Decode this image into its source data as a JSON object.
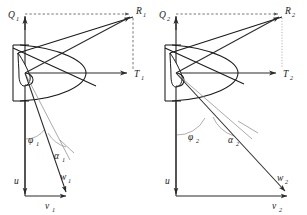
{
  "figure": {
    "type": "technical-diagram",
    "background_color": "#ffffff",
    "line_color": "#1a1a1a",
    "thin_line_color": "#8d8d8d",
    "dashed_line_color": "#4a4a4a",
    "panel_count": 2
  },
  "panels": [
    {
      "id": "panel-1",
      "index": 1,
      "labels": {
        "vertical_axis": "Q",
        "vertical_axis_sub": "1",
        "horizontal_axis": "T",
        "horizontal_axis_sub": "1",
        "resultant": "R",
        "resultant_sub": "1",
        "angle_phi": "φ",
        "angle_phi_sub": "1",
        "angle_alpha": "α",
        "angle_alpha_sub": "1",
        "blade_speed": "u",
        "blade_speed_sub": "",
        "relative_velocity": "w",
        "relative_velocity_sub": "1",
        "absolute_velocity": "v",
        "absolute_velocity_sub": "1"
      }
    },
    {
      "id": "panel-2",
      "index": 2,
      "labels": {
        "vertical_axis": "Q",
        "vertical_axis_sub": "2",
        "horizontal_axis": "T",
        "horizontal_axis_sub": "2",
        "resultant": "R",
        "resultant_sub": "2",
        "angle_phi": "φ",
        "angle_phi_sub": "2",
        "angle_alpha": "α",
        "angle_alpha_sub": "2",
        "blade_speed": "u",
        "blade_speed_sub": "",
        "relative_velocity": "w",
        "relative_velocity_sub": "2",
        "absolute_velocity": "v",
        "absolute_velocity_sub": "2"
      }
    }
  ]
}
